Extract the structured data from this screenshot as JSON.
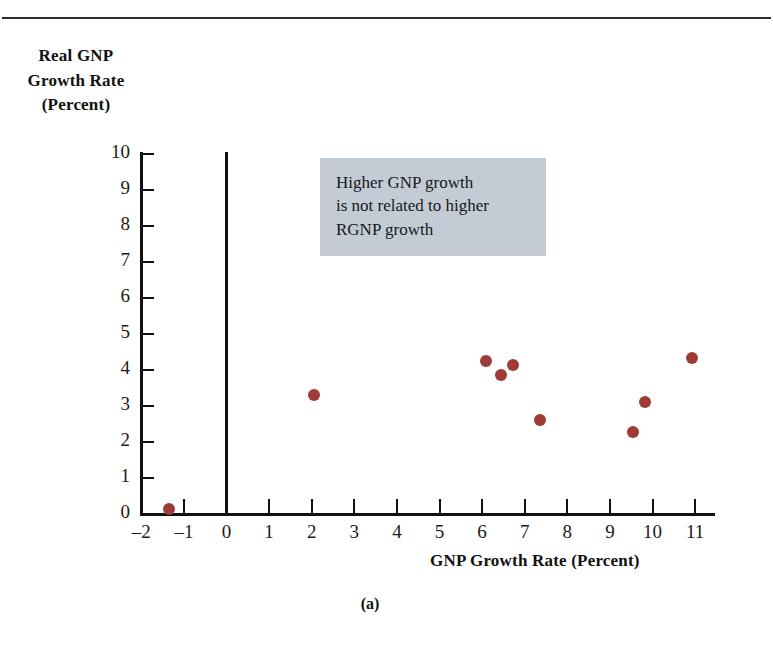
{
  "figure": {
    "caption": "(a)"
  },
  "annotation": {
    "lines": [
      "Higher GNP growth",
      "is not related to higher",
      "RGNP growth"
    ],
    "background_color": "#c3ccd4"
  },
  "chart_data": {
    "type": "scatter",
    "title": "",
    "xlabel": "GNP Growth Rate (Percent)",
    "ylabel_lines": [
      "Real GNP",
      "Growth Rate",
      "(Percent)"
    ],
    "xlim": [
      -2,
      11
    ],
    "ylim": [
      0,
      10
    ],
    "xticks": [
      -2,
      -1,
      0,
      1,
      2,
      3,
      4,
      5,
      6,
      7,
      8,
      9,
      10,
      11
    ],
    "xtick_labels": [
      "–2",
      "–1",
      "0",
      "1",
      "2",
      "3",
      "4",
      "5",
      "6",
      "7",
      "8",
      "9",
      "10",
      "11"
    ],
    "yticks": [
      0,
      1,
      2,
      3,
      4,
      5,
      6,
      7,
      8,
      9,
      10
    ],
    "ytick_labels": [
      "0",
      "1",
      "2",
      "3",
      "4",
      "5",
      "6",
      "7",
      "8",
      "9",
      "10"
    ],
    "grid": false,
    "legend": false,
    "marker_color": "#9e3b36",
    "marker_size_px": 12,
    "zero_reference_line_x": 0,
    "points": [
      {
        "x": -1.35,
        "y": 0.15
      },
      {
        "x": 2.05,
        "y": 3.3
      },
      {
        "x": 6.1,
        "y": 4.25
      },
      {
        "x": 6.45,
        "y": 3.87
      },
      {
        "x": 6.72,
        "y": 4.15
      },
      {
        "x": 7.37,
        "y": 2.6
      },
      {
        "x": 9.55,
        "y": 2.28
      },
      {
        "x": 9.82,
        "y": 3.12
      },
      {
        "x": 10.92,
        "y": 4.33
      }
    ]
  }
}
